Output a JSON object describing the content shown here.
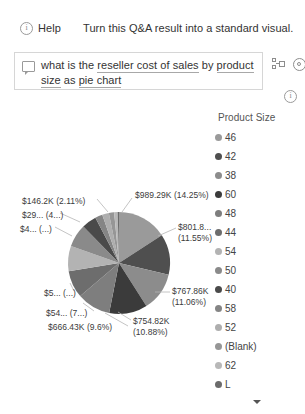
{
  "header": {
    "help_label": "Help",
    "help_icon": "info-circle-icon",
    "hint": "Turn this Q&A result into a standard visual."
  },
  "question_box": {
    "icon": "speech-bubble-icon",
    "full_text": "what is the reseller cost of sales by product size as pie chart",
    "segments": [
      {
        "text": "what is the ",
        "underlined": false
      },
      {
        "text": "reseller cost of sales",
        "underlined": true
      },
      {
        "text": " by ",
        "underlined": false
      },
      {
        "text": "product size",
        "underlined": true
      },
      {
        "text": " as ",
        "underlined": false
      },
      {
        "text": "pie chart",
        "underlined": true
      }
    ],
    "placeholder": "Ask a question about your data"
  },
  "toolbar": {
    "share_icon": "share-visual-icon",
    "settings_icon": "gear-icon",
    "info_icon": "info-circle-icon"
  },
  "legend": {
    "title": "Product Size",
    "scroll_indicator": "chevron-down-icon",
    "items": [
      {
        "label": "46",
        "color": "#9a9a9a"
      },
      {
        "label": "42",
        "color": "#4f4f4f"
      },
      {
        "label": "38",
        "color": "#8c8c8c"
      },
      {
        "label": "60",
        "color": "#3b3b3b"
      },
      {
        "label": "48",
        "color": "#7e7e7e"
      },
      {
        "label": "44",
        "color": "#6d6d6d"
      },
      {
        "label": "54",
        "color": "#b3b3b3"
      },
      {
        "label": "50",
        "color": "#8a8a8a"
      },
      {
        "label": "40",
        "color": "#4a4a4a"
      },
      {
        "label": "58",
        "color": "#858585"
      },
      {
        "label": "52",
        "color": "#aeaeae"
      },
      {
        "label": "(Blank)",
        "color": "#969696"
      },
      {
        "label": "62",
        "color": "#b8b8b8"
      },
      {
        "label": "L",
        "color": "#6b6b6b"
      }
    ]
  },
  "chart_data": {
    "type": "pie",
    "title": "",
    "value_field": "Reseller Cost of Sales",
    "category_field": "Product Size",
    "legend_position": "right",
    "grid": false,
    "slices": [
      {
        "category": "46",
        "value_label": "$989.29K",
        "percent_label": "14.25%",
        "percent": 14.25,
        "value": 989290,
        "color": "#9a9a9a",
        "data_label": "$989.29K (14.25%)",
        "label_side": "right"
      },
      {
        "category": "42",
        "value_label": "$801.8...",
        "percent_label": "11.55%",
        "percent": 11.55,
        "value": 801800,
        "color": "#4f4f4f",
        "data_label": "$801.8... (11.55%)",
        "label_side": "right"
      },
      {
        "category": "38",
        "value_label": "$767.86K",
        "percent_label": "11.06%",
        "percent": 11.06,
        "value": 767860,
        "color": "#8c8c8c",
        "data_label": "$767.86K (11.06%)",
        "label_side": "right"
      },
      {
        "category": "60",
        "value_label": "$754.82K",
        "percent_label": "10.88%",
        "percent": 10.88,
        "value": 754820,
        "color": "#3b3b3b",
        "data_label": "$754.82K (10.88%)",
        "label_side": "right"
      },
      {
        "category": "48",
        "value_label": "$666.43K",
        "percent_label": "9.6%",
        "percent": 9.6,
        "value": 666430,
        "color": "#7e7e7e",
        "data_label": "$666.43K (9.6%)",
        "label_side": "left"
      },
      {
        "category": "44",
        "value_label": "$54...",
        "percent_label": "7...",
        "percent": 7.8,
        "value": 541000,
        "color": "#6d6d6d",
        "data_label": "$54... (7...)",
        "label_side": "left"
      },
      {
        "category": "54",
        "value_label": "$5...",
        "percent_label": "...",
        "percent": 7.2,
        "value": 500000,
        "color": "#b3b3b3",
        "data_label": "$5... (...)",
        "label_side": "left"
      },
      {
        "category": "50",
        "value_label": "$4...",
        "percent_label": "...",
        "percent": 6.5,
        "value": 450000,
        "color": "#8a8a8a",
        "data_label": "$4... (...)",
        "label_side": "left"
      },
      {
        "category": "40",
        "value_label": "$29...",
        "percent_label": "4...",
        "percent": 4.2,
        "value": 290000,
        "color": "#4a4a4a",
        "data_label": "$29... (4...)",
        "label_side": "left"
      },
      {
        "category": "58",
        "value_label": "$146.2K",
        "percent_label": "2.11%",
        "percent": 2.11,
        "value": 146200,
        "color": "#858585",
        "data_label": "$146.2K (2.11%)",
        "label_side": "left"
      },
      {
        "category": "52",
        "value_label": "",
        "percent_label": "",
        "percent": 1.9,
        "value": 131000,
        "color": "#aeaeae",
        "data_label": "",
        "label_side": "none"
      },
      {
        "category": "(Blank)",
        "value_label": "",
        "percent_label": "",
        "percent": 1.5,
        "value": 104000,
        "color": "#969696",
        "data_label": "",
        "label_side": "none"
      },
      {
        "category": "62",
        "value_label": "",
        "percent_label": "",
        "percent": 1.0,
        "value": 69000,
        "color": "#b8b8b8",
        "data_label": "",
        "label_side": "none"
      },
      {
        "category": "L",
        "value_label": "",
        "percent_label": "",
        "percent": 0.38,
        "value": 26000,
        "color": "#6b6b6b",
        "data_label": "",
        "label_side": "none"
      }
    ]
  }
}
